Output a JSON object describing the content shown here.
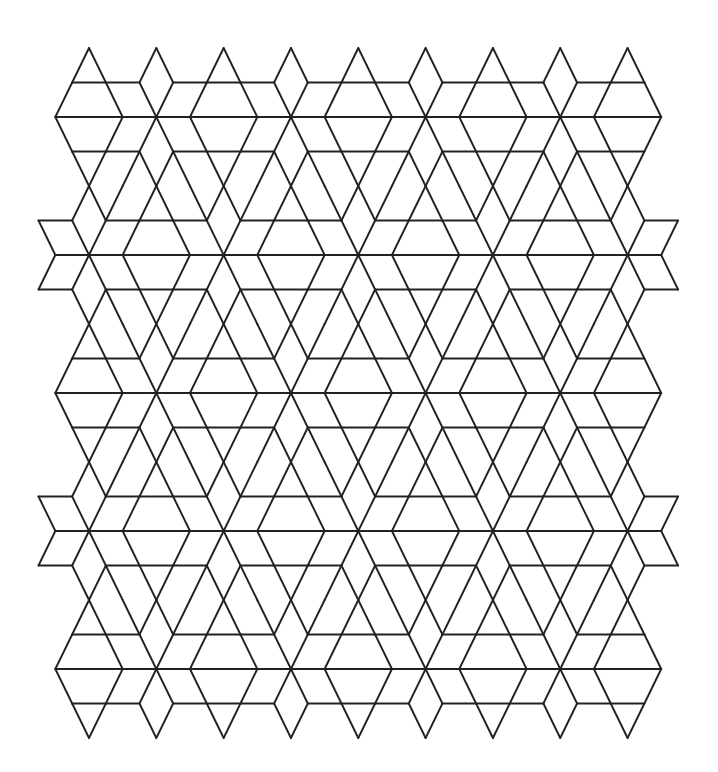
{
  "canvas": {
    "width": 718,
    "height": 772,
    "background": "#ffffff"
  },
  "tiling": {
    "description": "Periodic line tiling of hexagram stars (6 rhombi) with triangles, trapezoids and hexagons on a stretched triangular lattice",
    "stroke_color": "#222222",
    "stroke_width": 1.9,
    "origin_px": [
      89,
      48
    ],
    "unit_x_px": 16.83,
    "unit_row_px": 34.5,
    "rows": [
      0,
      20
    ],
    "x_max_mirror": 32,
    "left_bound_by_row_mod8": [
      0,
      -1,
      -2,
      -1,
      0,
      -3,
      -2,
      -3
    ],
    "edge_rows_x_multiple": 4,
    "star_rule": {
      "x_minus_r_mod8": 2,
      "x_plus_r_mod8": 6
    },
    "star_centers_visible": [
      [
        4,
        2
      ],
      [
        12,
        2
      ],
      [
        20,
        2
      ],
      [
        28,
        2
      ],
      [
        0,
        6
      ],
      [
        8,
        6
      ],
      [
        16,
        6
      ],
      [
        24,
        6
      ],
      [
        32,
        6
      ],
      [
        4,
        10
      ],
      [
        12,
        10
      ],
      [
        20,
        10
      ],
      [
        28,
        10
      ],
      [
        0,
        14
      ],
      [
        8,
        14
      ],
      [
        16,
        14
      ],
      [
        24,
        14
      ],
      [
        32,
        14
      ],
      [
        4,
        18
      ],
      [
        12,
        18
      ],
      [
        20,
        18
      ],
      [
        28,
        18
      ]
    ]
  }
}
